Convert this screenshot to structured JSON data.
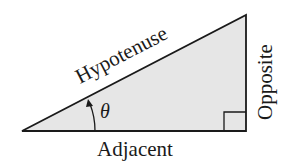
{
  "diagram": {
    "type": "right-triangle",
    "labels": {
      "hypotenuse": "Hypotenuse",
      "opposite": "Opposite",
      "adjacent": "Adjacent",
      "angle": "θ"
    },
    "colors": {
      "fill": "#e6e6e6",
      "stroke": "#1a1a1a"
    }
  }
}
